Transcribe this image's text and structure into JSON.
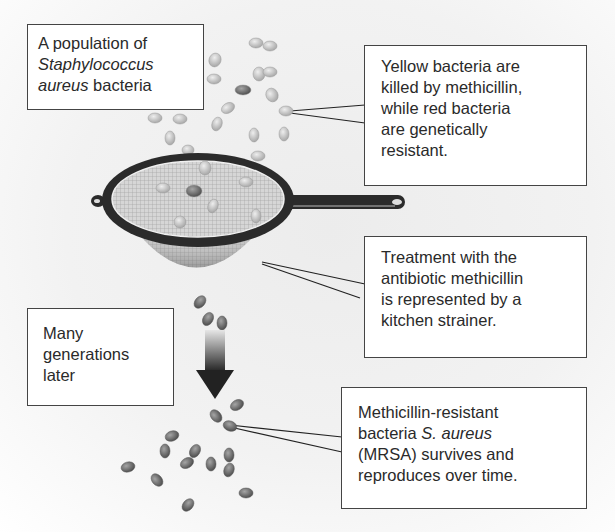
{
  "labels": {
    "population": {
      "line1": "A population of",
      "line2_italic": "Staphylococcus",
      "line3_italic": "aureus",
      "line3_rest": " bacteria"
    },
    "killed": {
      "lines": [
        "Yellow bacteria are",
        "killed by methicillin,",
        "while red bacteria",
        "are genetically",
        "resistant."
      ]
    },
    "treatment": {
      "lines": [
        "Treatment with the",
        "antibiotic methicillin",
        "is represented by a",
        "kitchen strainer."
      ]
    },
    "generations": {
      "lines": [
        "Many",
        "generations",
        "later"
      ]
    },
    "mrsa": {
      "line1": "Methicillin-resistant",
      "line2_plain": "bacteria ",
      "line2_italic": "S. aureus",
      "line3": "(MRSA) survives and",
      "line4": "reproduces over time."
    }
  },
  "icons": {
    "strainer": "kitchen-strainer-illustration",
    "arrow": "down-arrow-gradient",
    "bacteria": "bacteria-ovals"
  },
  "colors": {
    "yellow_bacteria": "#c8c8c8",
    "red_bacteria": "#7a7a7a",
    "strainer_rim": "#2b2b2b",
    "box_border": "#444444"
  }
}
